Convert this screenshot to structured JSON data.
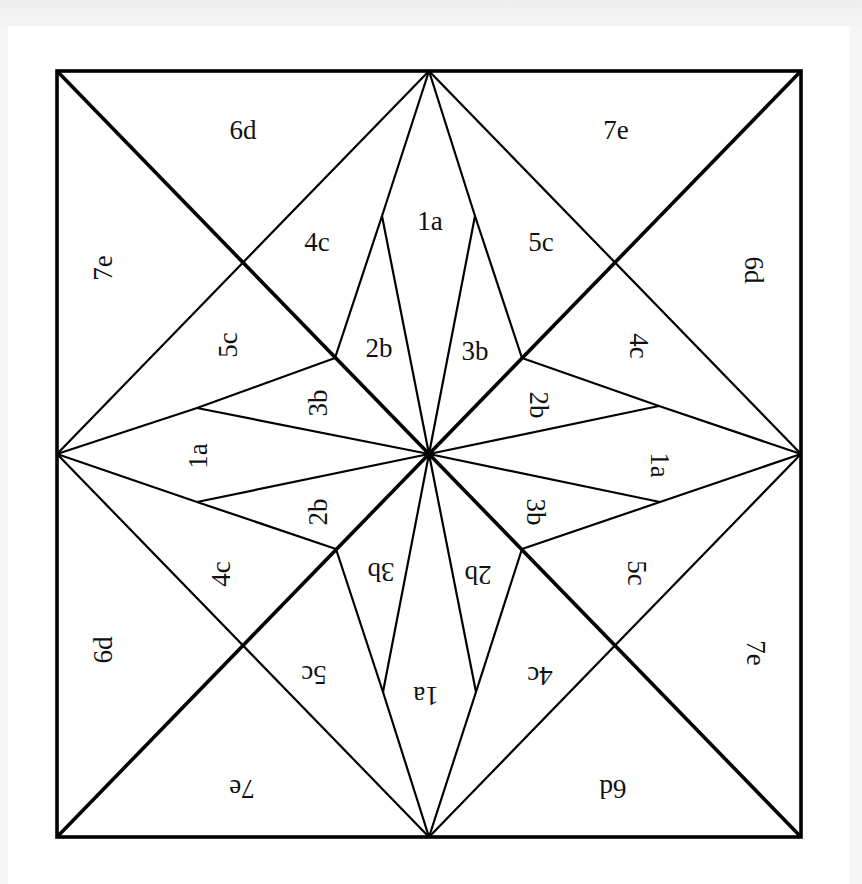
{
  "diagram": {
    "title": "",
    "type": "quilt-block-piecing-template",
    "colors": {
      "line": "#000000",
      "background": "#ffffff",
      "label": "#111111"
    },
    "square": {
      "x1": 57,
      "y1": 71,
      "x2": 801,
      "y2": 837
    },
    "center": {
      "x": 429,
      "y": 454
    },
    "labels": {
      "top": {
        "kite": "1a",
        "left_b": "2b",
        "right_b": "3b",
        "left_c": "4c",
        "right_c": "5c",
        "left_corner": "6d",
        "right_corner": "7e"
      },
      "left": {
        "kite": "1a",
        "upper_b": "3b",
        "lower_b": "2b",
        "upper_c": "5c",
        "lower_c": "4c",
        "upper_corner": "7e",
        "lower_corner": "6d"
      },
      "right": {
        "kite": "1a",
        "upper_b": "2b",
        "lower_b": "3b",
        "upper_c": "4c",
        "lower_c": "5c",
        "upper_corner": "6d",
        "lower_corner": "7e"
      },
      "bottom": {
        "kite": "1a",
        "left_b": "3b",
        "right_b": "2b",
        "left_c": "5c",
        "right_c": "4c",
        "left_corner": "7e",
        "right_corner": "6d"
      }
    }
  }
}
